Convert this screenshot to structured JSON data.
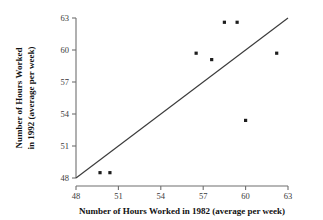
{
  "chart_data": {
    "type": "scatter",
    "title": "",
    "xlabel": "Number of Hours Worked in 1982 (average per week)",
    "ylabel_line1": "Number of Hours Worked",
    "ylabel_line2": "in 1992 (average per week)",
    "xlim": [
      48,
      63
    ],
    "ylim": [
      48,
      63
    ],
    "xticks": [
      48,
      51,
      54,
      57,
      60,
      63
    ],
    "yticks": [
      48,
      51,
      54,
      57,
      60,
      63
    ],
    "xtick_labels": [
      "48",
      "51",
      "54",
      "57",
      "60",
      "63"
    ],
    "ytick_labels": [
      "48",
      "51",
      "54",
      "57",
      "60",
      "63"
    ],
    "grid": false,
    "legend": false,
    "marker_color": "#1d1d1d",
    "line_color": "#3b3b3b",
    "axis_color": "#6f6f6f",
    "reference_line": {
      "description": "45-degree identity line",
      "x_start": 48.0,
      "y_start": 48.0,
      "x_end": 63.0,
      "y_end": 63.0
    },
    "points": [
      {
        "x": 49.7,
        "y": 48.5
      },
      {
        "x": 50.4,
        "y": 48.5
      },
      {
        "x": 56.5,
        "y": 59.7
      },
      {
        "x": 57.6,
        "y": 59.1
      },
      {
        "x": 58.5,
        "y": 62.6
      },
      {
        "x": 59.4,
        "y": 62.6
      },
      {
        "x": 60.0,
        "y": 53.4
      },
      {
        "x": 62.2,
        "y": 59.7
      }
    ]
  }
}
